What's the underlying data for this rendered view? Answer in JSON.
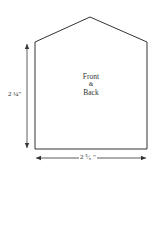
{
  "diagram": {
    "type": "pattern-piece",
    "shape": "house/pentagon",
    "piece_label": {
      "line1": "Front",
      "line2": "&",
      "line3": "Back"
    },
    "dimensions": {
      "height": "2 ¼\"",
      "width": "2 ⁵⁄₈ \""
    },
    "colors": {
      "stroke": "#333333",
      "background": "#ffffff",
      "text": "#333333"
    }
  }
}
